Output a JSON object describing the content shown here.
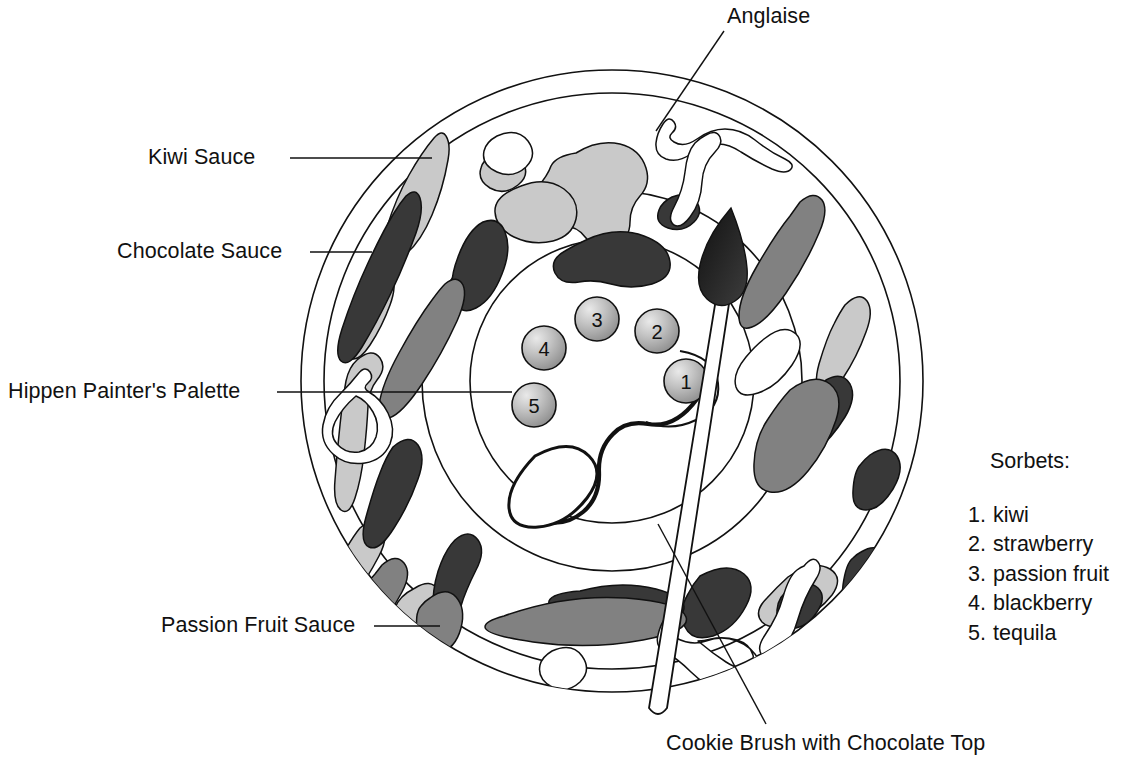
{
  "figure": {
    "background_color": "#ffffff",
    "ink_color": "#111111"
  },
  "labels": {
    "kiwi_sauce": "Kiwi Sauce",
    "chocolate_sauce": "Chocolate Sauce",
    "hippen_palette": "Hippen Painter's Palette",
    "passion_fruit_sauce": "Passion Fruit Sauce",
    "anglaise": "Anglaise",
    "cookie_brush": "Cookie Brush with Chocolate Top"
  },
  "legend": {
    "title": "Sorbets:",
    "items": [
      {
        "number": "1.",
        "name": "kiwi"
      },
      {
        "number": "2.",
        "name": "strawberry"
      },
      {
        "number": "3.",
        "name": "passion fruit"
      },
      {
        "number": "4.",
        "name": "blackberry"
      },
      {
        "number": "5.",
        "name": "tequila"
      }
    ]
  },
  "palette": {
    "scoops": [
      {
        "label": "1",
        "sorbet": "kiwi"
      },
      {
        "label": "2",
        "sorbet": "strawberry"
      },
      {
        "label": "3",
        "sorbet": "passion fruit"
      },
      {
        "label": "4",
        "sorbet": "blackberry"
      },
      {
        "label": "5",
        "sorbet": "tequila"
      }
    ]
  },
  "colors": {
    "kiwi_sauce": "#c9c9c9",
    "chocolate_sauce": "#383838",
    "passion_fruit_sauce": "#818181",
    "anglaise": "#ffffff",
    "outline": "#111111",
    "scoop_fill": "#b4b4b4"
  }
}
